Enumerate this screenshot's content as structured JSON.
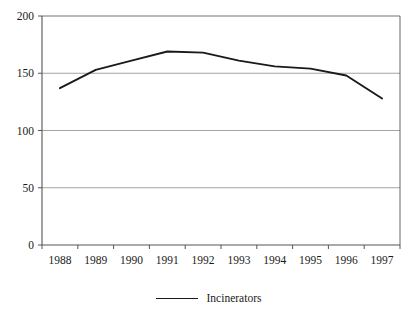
{
  "chart_data": {
    "type": "line",
    "title": "",
    "subtitle": "",
    "xlabel": "",
    "ylabel": "",
    "categories": [
      "1988",
      "1989",
      "1990",
      "1991",
      "1992",
      "1993",
      "1994",
      "1995",
      "1996",
      "1997"
    ],
    "series": [
      {
        "name": "Incinerators",
        "values": [
          137,
          153,
          161,
          169,
          168,
          161,
          156,
          154,
          148,
          128
        ],
        "color": "#1a1a1a"
      }
    ],
    "ylim": [
      0,
      200
    ],
    "yticks": [
      0,
      50,
      100,
      150,
      200
    ],
    "ytick_labels": [
      "0",
      "50",
      "100",
      "150",
      "200"
    ],
    "xtick_labels": [
      "1988",
      "1989",
      "1990",
      "1991",
      "1992",
      "1993",
      "1994",
      "1995",
      "1996",
      "1997"
    ],
    "grid": {
      "horizontal": true,
      "vertical": false,
      "color": "#9a9a9a"
    },
    "legend": {
      "position": "bottom",
      "entries": [
        {
          "label": "Incinerators",
          "marker": "line",
          "color": "#1a1a1a"
        }
      ]
    },
    "axis": {
      "color": "#555555",
      "frame": true
    },
    "background": "#ffffff"
  },
  "legend": {
    "incinerators_label": "Incinerators"
  }
}
